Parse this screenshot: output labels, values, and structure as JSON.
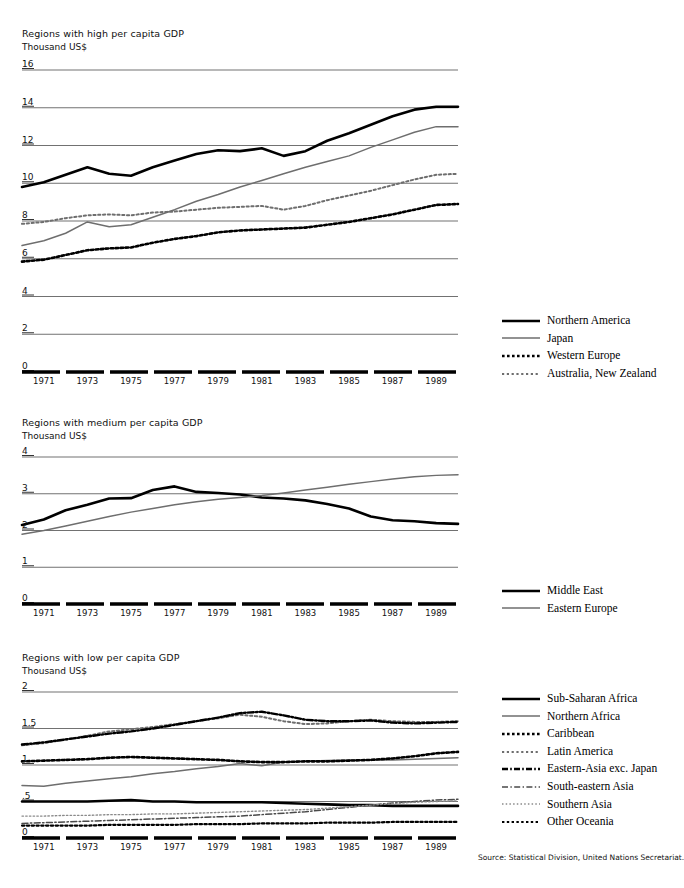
{
  "source_note": "Source: Statistical Division, United Nations Secretariat.",
  "panels": [
    {
      "id": "high",
      "title": "Regions with high per capita GDP",
      "unit": "Thousand US$",
      "legend": [
        {
          "label": "Northern America",
          "style": "solid-bold",
          "color": "#000000"
        },
        {
          "label": "Japan",
          "style": "solid-thin",
          "color": "#6e6e6e"
        },
        {
          "label": "Western Europe",
          "style": "dotted-bold",
          "color": "#000000"
        },
        {
          "label": "Australia, New Zealand",
          "style": "dotted-thin",
          "color": "#6e6e6e"
        }
      ]
    },
    {
      "id": "medium",
      "title": "Regions with medium per capita GDP",
      "unit": "Thousand US$",
      "legend": [
        {
          "label": "Middle East",
          "style": "solid-bold",
          "color": "#000000"
        },
        {
          "label": "Eastern Europe",
          "style": "solid-thin",
          "color": "#6e6e6e"
        }
      ]
    },
    {
      "id": "low",
      "title": "Regions with low per capita GDP",
      "unit": "Thousand US$",
      "legend": [
        {
          "label": "Sub-Saharan Africa",
          "style": "solid-bold",
          "color": "#000000"
        },
        {
          "label": "Northern Africa",
          "style": "solid-thin",
          "color": "#6e6e6e"
        },
        {
          "label": "Caribbean",
          "style": "dotted-bold",
          "color": "#000000"
        },
        {
          "label": "Latin America",
          "style": "dotted-thin",
          "color": "#6e6e6e"
        },
        {
          "label": "Eastern-Asia exc. Japan",
          "style": "dashdot-bold",
          "color": "#000000"
        },
        {
          "label": "South-eastern Asia",
          "style": "dashdot-thin",
          "color": "#4a4a4a"
        },
        {
          "label": "Southern Asia",
          "style": "dotted-fine",
          "color": "#8a8a8a"
        },
        {
          "label": "Other Oceania",
          "style": "dotted-bold2",
          "color": "#000000"
        }
      ]
    }
  ],
  "chart_data": [
    {
      "type": "line",
      "title": "Regions with high per capita GDP",
      "ylabel": "Thousand US$",
      "xlabel": "",
      "ylim": [
        0,
        16
      ],
      "yticks": [
        0,
        2,
        4,
        6,
        8,
        10,
        12,
        14,
        16
      ],
      "ytick_labels": [
        "0",
        "2",
        "4",
        "6",
        "8",
        "10",
        "12",
        "14",
        "16"
      ],
      "x": [
        1970,
        1971,
        1972,
        1973,
        1974,
        1975,
        1976,
        1977,
        1978,
        1979,
        1980,
        1981,
        1982,
        1983,
        1984,
        1985,
        1986,
        1987,
        1988,
        1989,
        1990
      ],
      "xtick_labels": [
        "1971",
        "1973",
        "1975",
        "1977",
        "1979",
        "1981",
        "1983",
        "1985",
        "1987",
        "1989"
      ],
      "xticks": [
        1971,
        1973,
        1975,
        1977,
        1979,
        1981,
        1983,
        1985,
        1987,
        1989
      ],
      "grid": true,
      "legend_position": "right",
      "series": [
        {
          "name": "Northern America",
          "values": [
            9.8,
            10.05,
            10.45,
            10.85,
            10.5,
            10.4,
            10.85,
            11.2,
            11.55,
            11.75,
            11.7,
            11.85,
            11.45,
            11.7,
            12.25,
            12.65,
            13.1,
            13.55,
            13.9,
            14.05,
            14.05
          ]
        },
        {
          "name": "Japan",
          "values": [
            6.7,
            6.95,
            7.35,
            7.95,
            7.7,
            7.8,
            8.2,
            8.6,
            9.05,
            9.4,
            9.8,
            10.15,
            10.5,
            10.85,
            11.15,
            11.45,
            11.9,
            12.3,
            12.7,
            13.0,
            13.0
          ]
        },
        {
          "name": "Western Europe",
          "values": [
            5.85,
            5.95,
            6.2,
            6.45,
            6.55,
            6.6,
            6.85,
            7.05,
            7.2,
            7.4,
            7.5,
            7.55,
            7.6,
            7.65,
            7.8,
            7.95,
            8.15,
            8.35,
            8.6,
            8.85,
            8.9
          ]
        },
        {
          "name": "Australia, New Zealand",
          "values": [
            7.85,
            7.95,
            8.15,
            8.3,
            8.35,
            8.3,
            8.45,
            8.5,
            8.6,
            8.7,
            8.75,
            8.8,
            8.6,
            8.8,
            9.1,
            9.35,
            9.6,
            9.9,
            10.2,
            10.45,
            10.5
          ]
        }
      ]
    },
    {
      "type": "line",
      "title": "Regions with medium per capita GDP",
      "ylabel": "Thousand US$",
      "xlabel": "",
      "ylim": [
        0,
        4
      ],
      "yticks": [
        0,
        1,
        2,
        3,
        4
      ],
      "ytick_labels": [
        "0",
        "1",
        "2",
        "3",
        "4"
      ],
      "x": [
        1970,
        1971,
        1972,
        1973,
        1974,
        1975,
        1976,
        1977,
        1978,
        1979,
        1980,
        1981,
        1982,
        1983,
        1984,
        1985,
        1986,
        1987,
        1988,
        1989,
        1990
      ],
      "xtick_labels": [
        "1971",
        "1973",
        "1975",
        "1977",
        "1979",
        "1981",
        "1983",
        "1985",
        "1987",
        "1989"
      ],
      "xticks": [
        1971,
        1973,
        1975,
        1977,
        1979,
        1981,
        1983,
        1985,
        1987,
        1989
      ],
      "grid": true,
      "legend_position": "right",
      "series": [
        {
          "name": "Middle East",
          "values": [
            2.15,
            2.3,
            2.55,
            2.7,
            2.87,
            2.88,
            3.1,
            3.2,
            3.05,
            3.02,
            2.98,
            2.9,
            2.87,
            2.82,
            2.72,
            2.6,
            2.38,
            2.28,
            2.25,
            2.2,
            2.18
          ]
        },
        {
          "name": "Eastern Europe",
          "values": [
            1.9,
            2.0,
            2.12,
            2.25,
            2.38,
            2.5,
            2.6,
            2.7,
            2.78,
            2.85,
            2.9,
            2.95,
            3.02,
            3.1,
            3.18,
            3.26,
            3.33,
            3.4,
            3.46,
            3.5,
            3.52
          ]
        }
      ]
    },
    {
      "type": "line",
      "title": "Regions with low per capita GDP",
      "ylabel": "Thousand US$",
      "xlabel": "",
      "ylim": [
        0,
        2
      ],
      "yticks": [
        0,
        0.5,
        1,
        1.5,
        2
      ],
      "ytick_labels": [
        "0",
        ".5",
        "1",
        "1.5",
        "2"
      ],
      "x": [
        1970,
        1971,
        1972,
        1973,
        1974,
        1975,
        1976,
        1977,
        1978,
        1979,
        1980,
        1981,
        1982,
        1983,
        1984,
        1985,
        1986,
        1987,
        1988,
        1989,
        1990
      ],
      "xtick_labels": [
        "1971",
        "1973",
        "1975",
        "1977",
        "1979",
        "1981",
        "1983",
        "1985",
        "1987",
        "1989"
      ],
      "xticks": [
        1971,
        1973,
        1975,
        1977,
        1979,
        1981,
        1983,
        1985,
        1987,
        1989
      ],
      "grid": true,
      "legend_position": "right",
      "series": [
        {
          "name": "Sub-Saharan Africa",
          "values": [
            0.5,
            0.5,
            0.5,
            0.5,
            0.51,
            0.52,
            0.5,
            0.5,
            0.49,
            0.49,
            0.49,
            0.49,
            0.48,
            0.47,
            0.46,
            0.45,
            0.45,
            0.44,
            0.44,
            0.44,
            0.44
          ]
        },
        {
          "name": "Northern Africa",
          "values": [
            0.72,
            0.71,
            0.75,
            0.78,
            0.81,
            0.84,
            0.88,
            0.91,
            0.95,
            0.98,
            1.02,
            0.99,
            1.04,
            1.05,
            1.06,
            1.07,
            1.07,
            1.07,
            1.08,
            1.09,
            1.1
          ]
        },
        {
          "name": "Caribbean",
          "values": [
            1.05,
            1.06,
            1.07,
            1.08,
            1.1,
            1.11,
            1.1,
            1.09,
            1.08,
            1.07,
            1.05,
            1.04,
            1.04,
            1.05,
            1.05,
            1.06,
            1.07,
            1.09,
            1.12,
            1.16,
            1.18
          ]
        },
        {
          "name": "Latin America",
          "values": [
            1.27,
            1.3,
            1.35,
            1.4,
            1.46,
            1.49,
            1.52,
            1.56,
            1.6,
            1.64,
            1.69,
            1.66,
            1.6,
            1.56,
            1.57,
            1.6,
            1.62,
            1.6,
            1.59,
            1.59,
            1.6
          ]
        },
        {
          "name": "Eastern-Asia exc. Japan",
          "values": [
            1.28,
            1.31,
            1.35,
            1.39,
            1.43,
            1.46,
            1.5,
            1.55,
            1.6,
            1.65,
            1.71,
            1.73,
            1.68,
            1.62,
            1.6,
            1.6,
            1.61,
            1.58,
            1.57,
            1.58,
            1.59
          ]
        },
        {
          "name": "South-eastern Asia",
          "values": [
            0.2,
            0.21,
            0.22,
            0.23,
            0.24,
            0.25,
            0.26,
            0.27,
            0.28,
            0.29,
            0.3,
            0.32,
            0.34,
            0.36,
            0.39,
            0.42,
            0.45,
            0.48,
            0.5,
            0.52,
            0.53
          ]
        },
        {
          "name": "Southern Asia",
          "values": [
            0.3,
            0.3,
            0.31,
            0.31,
            0.32,
            0.32,
            0.33,
            0.33,
            0.34,
            0.35,
            0.36,
            0.37,
            0.38,
            0.39,
            0.41,
            0.43,
            0.45,
            0.47,
            0.49,
            0.5,
            0.51
          ]
        },
        {
          "name": "Other Oceania",
          "values": [
            0.17,
            0.17,
            0.17,
            0.17,
            0.18,
            0.18,
            0.18,
            0.18,
            0.19,
            0.19,
            0.19,
            0.2,
            0.2,
            0.2,
            0.21,
            0.21,
            0.21,
            0.22,
            0.22,
            0.22,
            0.22
          ]
        }
      ]
    }
  ]
}
